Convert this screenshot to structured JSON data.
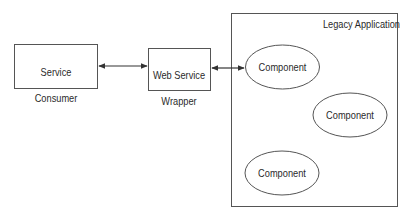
{
  "diagram": {
    "nodes": {
      "service_consumer": {
        "label_line1": "Service",
        "label_line2": "Consumer"
      },
      "web_service_wrapper": {
        "label_line1": "Web Service",
        "label_line2": "Wrapper"
      },
      "legacy_application": {
        "label": "Legacy Application"
      },
      "components": [
        {
          "label": "Component"
        },
        {
          "label": "Component"
        },
        {
          "label": "Component"
        }
      ]
    },
    "edges": [
      {
        "from": "Service Consumer",
        "to": "Web Service Wrapper",
        "type": "bidirectional"
      },
      {
        "from": "Web Service Wrapper",
        "to": "Component",
        "type": "bidirectional"
      }
    ],
    "colors": {
      "stroke": "#555555",
      "text": "#2a2a2a",
      "background": "#ffffff"
    }
  }
}
